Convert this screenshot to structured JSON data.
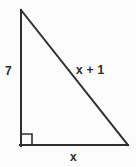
{
  "figure": {
    "name": "right-triangle-diagram",
    "shape": "right triangle",
    "background_color": "#fcfcfc",
    "stroke_color": "#2f2f2f",
    "stroke_width": 2,
    "label_color": "#2b2b2b",
    "vertices": {
      "apex_top_left": {
        "x": 20,
        "y": 10
      },
      "corner_bottom_left": {
        "x": 20,
        "y": 146
      },
      "corner_bottom_right": {
        "x": 128,
        "y": 146
      }
    },
    "right_angle_marker": {
      "name": "right-angle-square",
      "vertex": "corner_bottom_left",
      "size": 11
    },
    "labels": {
      "vertical_leg": "7",
      "hypotenuse": "x + 1",
      "horizontal_leg": "x"
    }
  }
}
